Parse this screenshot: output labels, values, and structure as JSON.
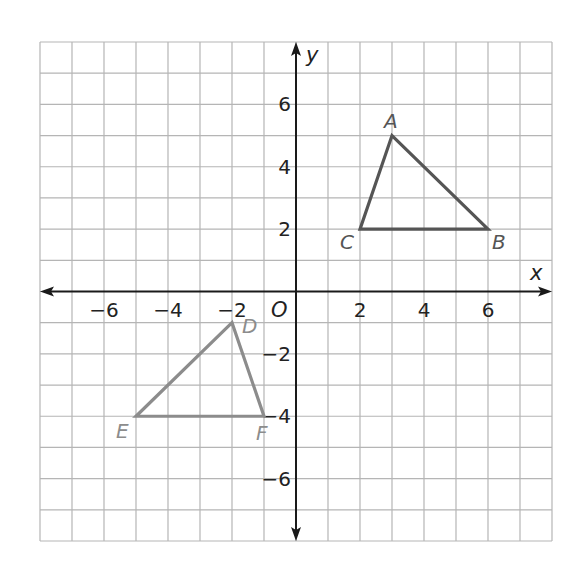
{
  "chart_data": {
    "type": "scatter",
    "title": "",
    "xlabel": "x",
    "ylabel": "y",
    "origin_label": "O",
    "xlim": [
      -8,
      8
    ],
    "ylim": [
      -8,
      8
    ],
    "grid": true,
    "x_ticks": [
      -6,
      -4,
      -2,
      2,
      4,
      6
    ],
    "y_ticks": [
      6,
      4,
      2,
      -2,
      -4,
      -6
    ],
    "x_tick_labels": [
      "−6",
      "−4",
      "−2",
      "2",
      "4",
      "6"
    ],
    "y_tick_labels": [
      "6",
      "4",
      "2",
      "−2",
      "−4",
      "−6"
    ],
    "series": [
      {
        "name": "Triangle ABC",
        "color": "#555555",
        "closed": true,
        "points": [
          {
            "label": "A",
            "x": 3,
            "y": 5
          },
          {
            "label": "B",
            "x": 6,
            "y": 2
          },
          {
            "label": "C",
            "x": 2,
            "y": 2
          }
        ]
      },
      {
        "name": "Triangle DEF",
        "color": "#8c8c8c",
        "closed": true,
        "points": [
          {
            "label": "D",
            "x": -2,
            "y": -1
          },
          {
            "label": "E",
            "x": -5,
            "y": -4
          },
          {
            "label": "F",
            "x": -1,
            "y": -4
          }
        ]
      }
    ]
  },
  "colors": {
    "grid": "#b5b5b5",
    "axis": "#1a1a1a",
    "triangle_abc": "#555555",
    "triangle_def": "#8c8c8c"
  }
}
